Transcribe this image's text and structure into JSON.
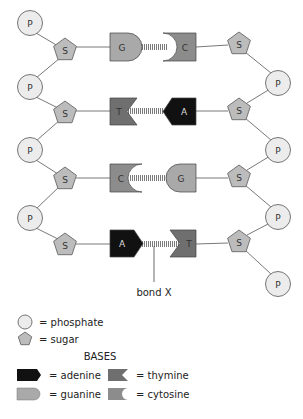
{
  "diagram": {
    "colors": {
      "phosphate": "#ececec",
      "sugar": "#bcbcbc",
      "adenine": "#111111",
      "thymine": "#6f6f6f",
      "guanine": "#a9a9a9",
      "cytosine": "#8c8c8c",
      "bond": "#888888"
    },
    "left_strand": {
      "phosphates": [
        {
          "label": "P",
          "x": 30,
          "y": 23
        },
        {
          "label": "P",
          "x": 30,
          "y": 87
        },
        {
          "label": "P",
          "x": 30,
          "y": 150
        },
        {
          "label": "P",
          "x": 30,
          "y": 218
        }
      ],
      "sugars": [
        {
          "label": "S",
          "x": 65,
          "y": 50
        },
        {
          "label": "S",
          "x": 65,
          "y": 112
        },
        {
          "label": "S",
          "x": 65,
          "y": 178
        },
        {
          "label": "S",
          "x": 65,
          "y": 243
        }
      ]
    },
    "right_strand": {
      "phosphates": [
        {
          "label": "P",
          "x": 278,
          "y": 83
        },
        {
          "label": "P",
          "x": 278,
          "y": 150
        },
        {
          "label": "P",
          "x": 278,
          "y": 217
        },
        {
          "label": "P",
          "x": 278,
          "y": 284
        }
      ],
      "sugars": [
        {
          "label": "S",
          "x": 239,
          "y": 43
        },
        {
          "label": "S",
          "x": 239,
          "y": 109
        },
        {
          "label": "S",
          "x": 239,
          "y": 176
        },
        {
          "label": "S",
          "x": 239,
          "y": 241
        }
      ]
    },
    "base_pairs": [
      {
        "left": "G",
        "right": "C",
        "y": 47
      },
      {
        "left": "T",
        "right": "A",
        "y": 111
      },
      {
        "left": "C",
        "right": "G",
        "y": 178
      },
      {
        "left": "A",
        "right": "T",
        "y": 244
      }
    ],
    "annotation": {
      "label": "bond X"
    }
  },
  "legend": {
    "phosphate": "= phosphate",
    "sugar": "= sugar",
    "bases_heading": "BASES",
    "adenine": "= adenine",
    "thymine": "= thymine",
    "guanine": "= guanine",
    "cytosine": "= cytosine"
  }
}
